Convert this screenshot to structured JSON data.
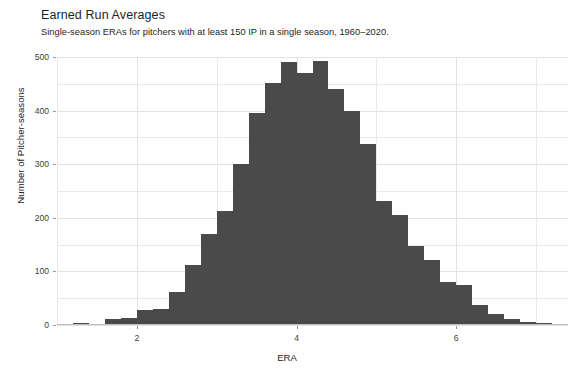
{
  "chart_data": {
    "type": "bar",
    "title": "Earned Run Averages",
    "subtitle": "Single-season ERAs for pitchers with at least 150 IP in a single season, 1960–2020.",
    "xlabel": "ERA",
    "ylabel": "Number of Pitcher-seasons",
    "xlim": [
      1.0,
      7.4
    ],
    "ylim": [
      0,
      500
    ],
    "bin_width": 0.2,
    "grid": true,
    "legend": null,
    "bar_color": "#4a4a4a",
    "xticks": [
      2,
      4,
      6
    ],
    "xtick_labels": [
      "2",
      "4",
      "6"
    ],
    "yticks": [
      0,
      100,
      200,
      300,
      400,
      500
    ],
    "ytick_labels": [
      "0",
      "100",
      "200",
      "300",
      "400",
      "500"
    ],
    "y_minor_ticks": [
      50,
      150,
      250,
      350,
      450
    ],
    "x_minor_ticks": [
      1,
      3,
      5,
      7
    ],
    "bins": [
      {
        "x0": 1.0,
        "x1": 1.2,
        "value": 0
      },
      {
        "x0": 1.2,
        "x1": 1.4,
        "value": 3
      },
      {
        "x0": 1.4,
        "x1": 1.6,
        "value": 0
      },
      {
        "x0": 1.6,
        "x1": 1.8,
        "value": 12
      },
      {
        "x0": 1.8,
        "x1": 2.0,
        "value": 13
      },
      {
        "x0": 2.0,
        "x1": 2.2,
        "value": 28
      },
      {
        "x0": 2.2,
        "x1": 2.4,
        "value": 30
      },
      {
        "x0": 2.4,
        "x1": 2.6,
        "value": 62
      },
      {
        "x0": 2.6,
        "x1": 2.8,
        "value": 112
      },
      {
        "x0": 2.8,
        "x1": 3.0,
        "value": 170
      },
      {
        "x0": 3.0,
        "x1": 3.2,
        "value": 212
      },
      {
        "x0": 3.2,
        "x1": 3.4,
        "value": 300
      },
      {
        "x0": 3.4,
        "x1": 3.6,
        "value": 395
      },
      {
        "x0": 3.6,
        "x1": 3.8,
        "value": 452
      },
      {
        "x0": 3.8,
        "x1": 4.0,
        "value": 490
      },
      {
        "x0": 4.0,
        "x1": 4.2,
        "value": 470
      },
      {
        "x0": 4.2,
        "x1": 4.4,
        "value": 493
      },
      {
        "x0": 4.4,
        "x1": 4.6,
        "value": 440
      },
      {
        "x0": 4.6,
        "x1": 4.8,
        "value": 400
      },
      {
        "x0": 4.8,
        "x1": 5.0,
        "value": 338
      },
      {
        "x0": 5.0,
        "x1": 5.2,
        "value": 232
      },
      {
        "x0": 5.2,
        "x1": 5.4,
        "value": 205
      },
      {
        "x0": 5.4,
        "x1": 5.6,
        "value": 147
      },
      {
        "x0": 5.6,
        "x1": 5.8,
        "value": 122
      },
      {
        "x0": 5.8,
        "x1": 6.0,
        "value": 80
      },
      {
        "x0": 6.0,
        "x1": 6.2,
        "value": 75
      },
      {
        "x0": 6.2,
        "x1": 6.4,
        "value": 38
      },
      {
        "x0": 6.4,
        "x1": 6.6,
        "value": 20
      },
      {
        "x0": 6.6,
        "x1": 6.8,
        "value": 12
      },
      {
        "x0": 6.8,
        "x1": 7.0,
        "value": 5
      },
      {
        "x0": 7.0,
        "x1": 7.2,
        "value": 4
      },
      {
        "x0": 7.2,
        "x1": 7.4,
        "value": 2
      }
    ]
  }
}
